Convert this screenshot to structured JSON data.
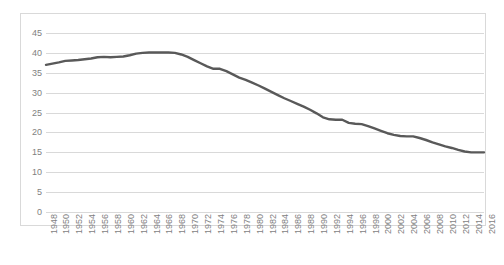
{
  "chart_data": {
    "type": "line",
    "title": "",
    "subtitle": "",
    "xlabel": "",
    "ylabel": "",
    "ylim": [
      0,
      45
    ],
    "ytick_labels": [
      "45",
      "40",
      "35",
      "30",
      "25",
      "20",
      "15",
      "10",
      "5",
      "0"
    ],
    "ytick_values": [
      45,
      40,
      35,
      30,
      25,
      20,
      15,
      10,
      5,
      0
    ],
    "grid": true,
    "grid_axis": "y",
    "legend": false,
    "legend_position": "none",
    "line_color": "#595959",
    "gridline_color": "#d9d9d9",
    "tick_label_color": "#7f7f7f",
    "xtick_labels": [
      "1948",
      "1950",
      "1952",
      "1954",
      "1956",
      "1958",
      "1960",
      "1962",
      "1964",
      "1966",
      "1968",
      "1970",
      "1972",
      "1974",
      "1976",
      "1978",
      "1980",
      "1982",
      "1984",
      "1986",
      "1988",
      "1990",
      "1992",
      "1994",
      "1996",
      "1998",
      "2000",
      "2002",
      "2004",
      "2006",
      "2008",
      "2010",
      "2012",
      "2014",
      "2016"
    ],
    "xtick_rotation": 90,
    "xtick_step": 2,
    "x": [
      1948,
      1949,
      1950,
      1951,
      1952,
      1953,
      1954,
      1955,
      1956,
      1957,
      1958,
      1959,
      1960,
      1961,
      1962,
      1963,
      1964,
      1965,
      1966,
      1967,
      1968,
      1969,
      1970,
      1971,
      1972,
      1973,
      1974,
      1975,
      1976,
      1977,
      1978,
      1979,
      1980,
      1981,
      1982,
      1983,
      1984,
      1985,
      1986,
      1987,
      1988,
      1989,
      1990,
      1991,
      1992,
      1993,
      1994,
      1995,
      1996,
      1997,
      1998,
      1999,
      2000,
      2001,
      2002,
      2003,
      2004,
      2005,
      2006,
      2007,
      2008,
      2009,
      2010,
      2011,
      2012,
      2013,
      2014,
      2015,
      2016
    ],
    "values": [
      37.0,
      37.3,
      37.6,
      38.0,
      38.1,
      38.2,
      38.4,
      38.6,
      38.9,
      39.0,
      38.9,
      39.0,
      39.1,
      39.4,
      39.8,
      40.0,
      40.1,
      40.1,
      40.1,
      40.1,
      40.0,
      39.6,
      39.0,
      38.2,
      37.4,
      36.6,
      36.0,
      36.0,
      35.4,
      34.6,
      33.8,
      33.2,
      32.5,
      31.8,
      31.0,
      30.2,
      29.4,
      28.6,
      27.9,
      27.2,
      26.5,
      25.7,
      24.8,
      23.8,
      23.3,
      23.2,
      23.2,
      22.4,
      22.2,
      22.1,
      21.6,
      21.0,
      20.4,
      19.8,
      19.4,
      19.1,
      19.0,
      19.0,
      18.6,
      18.1,
      17.5,
      17.0,
      16.5,
      16.1,
      15.6,
      15.2,
      15.0,
      15.0,
      15.0
    ],
    "series": [
      {
        "name": "",
        "values": [
          37.0,
          37.3,
          37.6,
          38.0,
          38.1,
          38.2,
          38.4,
          38.6,
          38.9,
          39.0,
          38.9,
          39.0,
          39.1,
          39.4,
          39.8,
          40.0,
          40.1,
          40.1,
          40.1,
          40.1,
          40.0,
          39.6,
          39.0,
          38.2,
          37.4,
          36.6,
          36.0,
          36.0,
          35.4,
          34.6,
          33.8,
          33.2,
          32.5,
          31.8,
          31.0,
          30.2,
          29.4,
          28.6,
          27.9,
          27.2,
          26.5,
          25.7,
          24.8,
          23.8,
          23.3,
          23.2,
          23.2,
          22.4,
          22.2,
          22.1,
          21.6,
          21.0,
          20.4,
          19.8,
          19.4,
          19.1,
          19.0,
          19.0,
          18.6,
          18.1,
          17.5,
          17.0,
          16.5,
          16.1,
          15.6,
          15.2,
          15.0,
          15.0,
          15.0
        ]
      }
    ]
  }
}
